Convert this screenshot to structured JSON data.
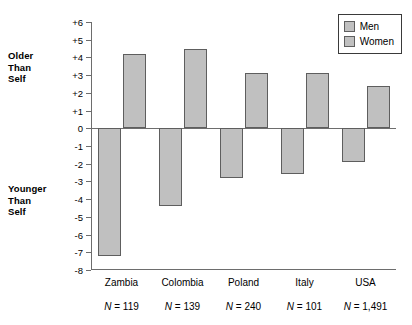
{
  "chart_data": {
    "type": "bar",
    "title": "",
    "subtitle": "",
    "xlabel": "",
    "ylabel": "",
    "ylim": [
      -8,
      6
    ],
    "grid": false,
    "legend_position": "top-right",
    "categories": [
      "Zambia",
      "Colombia",
      "Poland",
      "Italy",
      "USA"
    ],
    "series": [
      {
        "name": "Men",
        "values": [
          -7.2,
          -4.4,
          -2.8,
          -2.6,
          -1.9
        ]
      },
      {
        "name": "Women",
        "values": [
          4.2,
          4.5,
          3.1,
          3.1,
          2.4
        ]
      }
    ],
    "y_tick_labels": [
      "+6",
      "+5",
      "+4",
      "+3",
      "+2",
      "+1",
      "0",
      "-1",
      "-2",
      "-3",
      "-4",
      "-5",
      "-6",
      "-7",
      "-8"
    ],
    "y_tick_values": [
      6,
      5,
      4,
      3,
      2,
      1,
      0,
      -1,
      -2,
      -3,
      -4,
      -5,
      -6,
      -7,
      -8
    ],
    "annotations": {
      "upper_axis_label": "Older\nThan\nSelf",
      "lower_axis_label": "Younger\nThan\nSelf"
    },
    "sample_sizes": [
      "N = 119",
      "N = 139",
      "N = 240",
      "N = 101",
      "N = 1,491"
    ],
    "colors": {
      "bar_fill": "#c0c0c0",
      "bar_stroke": "#5e5e5e",
      "axis": "#6d6d6d",
      "text": "#000000",
      "background": "#ffffff"
    }
  },
  "legend": {
    "items": [
      {
        "label": "Men"
      },
      {
        "label": "Women"
      }
    ]
  }
}
